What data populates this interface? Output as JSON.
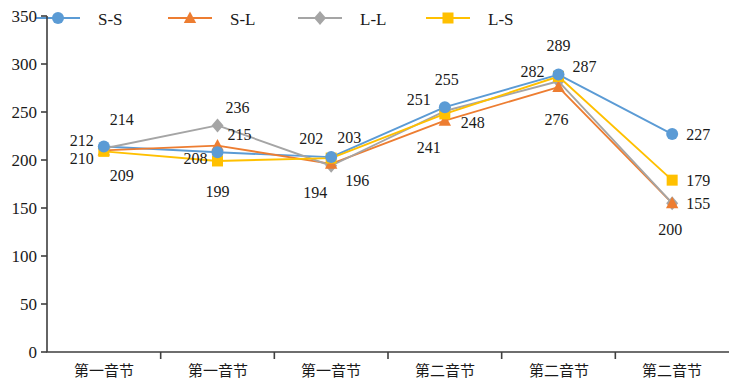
{
  "chart_data": {
    "type": "line",
    "title": "",
    "xlabel": "",
    "ylabel": "",
    "ylim": [
      0,
      350
    ],
    "ytick_step": 50,
    "grid": false,
    "legend_position": "top",
    "categories": [
      "第一音节",
      "第一音节",
      "第一音节",
      "第二音节",
      "第二音节",
      "第二音节"
    ],
    "yticks": [
      "0",
      "50",
      "100",
      "150",
      "200",
      "250",
      "300",
      "350"
    ],
    "series": [
      {
        "name": "S-S",
        "color": "#5B9BD5",
        "marker": "circle",
        "values": [
          214,
          208,
          203,
          255,
          289,
          227
        ],
        "labels": [
          "214",
          "208",
          "203",
          "255",
          "289",
          "227"
        ]
      },
      {
        "name": "S-L",
        "color": "#ED7D31",
        "marker": "triangle",
        "values": [
          210,
          215,
          196,
          241,
          276,
          155
        ],
        "labels": [
          "210",
          "215",
          "196",
          "241",
          "276",
          "155"
        ]
      },
      {
        "name": "L-L",
        "color": "#A5A5A5",
        "marker": "diamond",
        "values": [
          212,
          236,
          194,
          251,
          282,
          155
        ],
        "labels": [
          "212",
          "236",
          "194",
          "251",
          "282",
          "200"
        ]
      },
      {
        "name": "L-S",
        "color": "#FFC000",
        "marker": "square",
        "values": [
          209,
          199,
          202,
          248,
          287,
          179
        ],
        "labels": [
          "209",
          "199",
          "202",
          "248",
          "287",
          "179"
        ]
      }
    ]
  },
  "annotations": {
    "cluster_label_positions": [
      [
        {
          "s": 0,
          "x": 110,
          "y": 132,
          "t": "214"
        },
        {
          "s": 1,
          "x": 72,
          "y": 166,
          "t": "210"
        },
        {
          "s": 2,
          "x": 70,
          "y": 150,
          "t": "212"
        },
        {
          "s": 3,
          "x": 108,
          "y": 182,
          "t": "209"
        }
      ],
      [
        {
          "s": 0,
          "x": 182,
          "y": 163,
          "t": "208"
        },
        {
          "s": 1,
          "x": 228,
          "y": 146,
          "t": "215"
        },
        {
          "s": 2,
          "x": 222,
          "y": 116,
          "t": "236"
        },
        {
          "s": 3,
          "x": 196,
          "y": 190,
          "t": "199"
        }
      ],
      [
        {
          "s": 0,
          "x": 330,
          "y": 148,
          "t": "203"
        },
        {
          "s": 1,
          "x": 345,
          "y": 185,
          "t": "196"
        },
        {
          "s": 2,
          "x": 298,
          "y": 148,
          "t": "194_alt"
        },
        {
          "s": 3,
          "x": 296,
          "y": 148,
          "t": "202"
        }
      ]
    ]
  }
}
